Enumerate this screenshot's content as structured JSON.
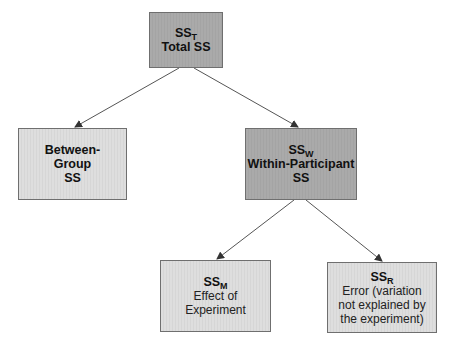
{
  "diagram": {
    "colors": {
      "dark_fill": "#a9a9a9",
      "light_fill": "#dcdcdc",
      "border": "#6f6f6f",
      "arrow": "#555555"
    },
    "nodes": {
      "total": {
        "symbol": "SS",
        "subscript": "T",
        "lines": [
          "Total SS"
        ]
      },
      "between": {
        "lines": [
          "Between-",
          "Group",
          "SS"
        ]
      },
      "within": {
        "symbol": "SS",
        "subscript": "W",
        "lines": [
          "Within-Participant",
          "SS"
        ]
      },
      "model": {
        "symbol": "SS",
        "subscript": "M",
        "lines": [
          "Effect of",
          "Experiment"
        ]
      },
      "residual": {
        "symbol": "SS",
        "subscript": "R",
        "lines": [
          "Error (variation",
          "not explained by",
          "the experiment)"
        ]
      }
    },
    "edges": [
      {
        "from": "total",
        "to": "between"
      },
      {
        "from": "total",
        "to": "within"
      },
      {
        "from": "within",
        "to": "model"
      },
      {
        "from": "within",
        "to": "residual"
      }
    ]
  }
}
